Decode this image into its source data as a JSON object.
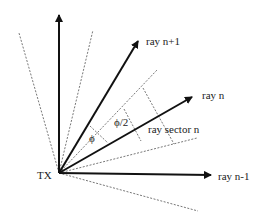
{
  "diagram": {
    "origin_label": "TX",
    "rays": [
      {
        "id": "vertical",
        "label": ""
      },
      {
        "id": "ray-n-plus-1",
        "label": "ray n+1"
      },
      {
        "id": "ray-n",
        "label": "ray n"
      },
      {
        "id": "ray-n-minus-1",
        "label": "ray n-1"
      }
    ],
    "sector_label": "ray sector n",
    "angle_labels": {
      "phi": "ϕ",
      "half_phi": "ϕ/2"
    },
    "colors": {
      "solid": "#111111",
      "dashed": "#555555",
      "background": "#ffffff"
    }
  }
}
